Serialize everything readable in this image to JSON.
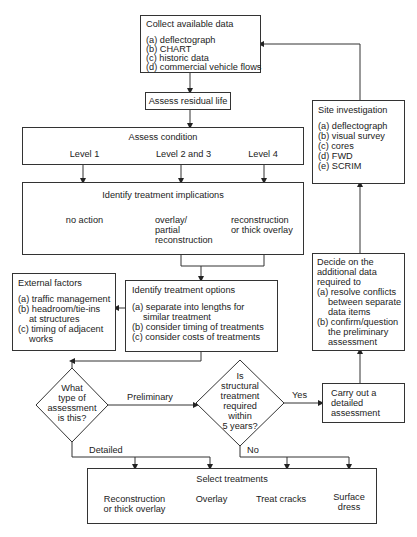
{
  "collect": {
    "title": "Collect available data",
    "items": [
      "(a) deflectograph",
      "(b) CHART",
      "(c) historic data",
      "(d) commercial vehicle flows"
    ]
  },
  "residual": {
    "title": "Assess residual life"
  },
  "condition": {
    "title": "Assess condition",
    "levels": [
      "Level 1",
      "Level 2 and 3",
      "Level 4"
    ]
  },
  "implications": {
    "title": "Identify treatment implications",
    "columns": [
      "no action",
      "overlay/\npartial\nreconstruction",
      "reconstruction\nor thick overlay"
    ]
  },
  "external": {
    "title": "External factors",
    "items": [
      "(a) traffic management",
      "(b) headroom/tie-ins",
      "at structures",
      "(c) timing of adjacent",
      "works"
    ]
  },
  "options": {
    "title": "Identify treatment options",
    "items": [
      "(a) separate into lengths for",
      "similar treatment",
      "(b) consider timing of treatments",
      "(c) consider costs of treatments"
    ]
  },
  "site": {
    "title": "Site investigation",
    "items": [
      "(a) deflectograph",
      "(b) visual survey",
      "(c) cores",
      "(d) FWD",
      "(e) SCRIM"
    ]
  },
  "decide": {
    "lines": [
      "Decide on the",
      "additional data",
      "required to",
      "(a) resolve conflicts",
      "between separate",
      "data items",
      "(b) confirm/question",
      "the preliminary",
      "assessment"
    ]
  },
  "detailed_box": {
    "lines": [
      "Carry out a",
      "detailed",
      "assessment"
    ]
  },
  "q1": {
    "lines": [
      "What",
      "type of",
      "assessment",
      "is this?"
    ]
  },
  "q2": {
    "lines": [
      "Is",
      "structural",
      "treatment",
      "required",
      "within",
      "5 years?"
    ]
  },
  "edge_labels": {
    "preliminary": "Preliminary",
    "detailed": "Detailed",
    "yes": "Yes",
    "no": "No"
  },
  "select": {
    "title": "Select treatments",
    "columns": [
      "Reconstruction\nor thick overlay",
      "Overlay",
      "Treat cracks",
      "Surface\ndress"
    ]
  }
}
